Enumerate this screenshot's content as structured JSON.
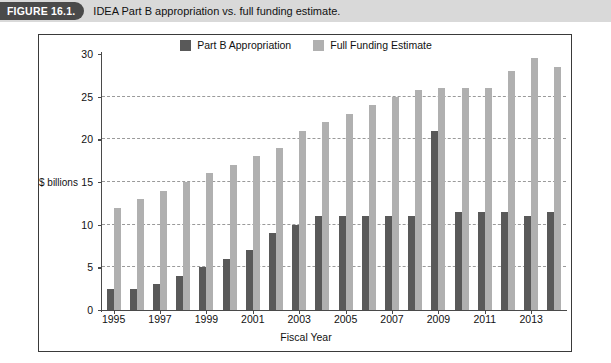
{
  "caption": {
    "figure_tag": "FIGURE 16.1.",
    "text": "IDEA Part B appropriation vs. full funding estimate."
  },
  "colors": {
    "dark_series": "#595959",
    "light_series": "#b0b0b0",
    "caption_band": "#d9d9d9",
    "figure_tag_bg": "#4a4a4a",
    "axis": "#4a4a4a",
    "gridline": "#9a9a9a"
  },
  "chart_data": {
    "type": "bar",
    "title": "",
    "xlabel": "Fiscal Year",
    "ylabel": "$ billions",
    "ylim": [
      0,
      30
    ],
    "yticks": [
      0,
      5,
      10,
      15,
      20,
      25,
      30
    ],
    "ytick_labels": [
      "0",
      "5",
      "10",
      "15",
      "20",
      "25",
      "30"
    ],
    "grid": true,
    "grid_axis": "y",
    "legend_position": "top-center",
    "categories": [
      "1995",
      "1996",
      "1997",
      "1998",
      "1999",
      "2000",
      "2001",
      "2002",
      "2003",
      "2004",
      "2005",
      "2006",
      "2007",
      "2008",
      "2009",
      "2010",
      "2011",
      "2012",
      "2013",
      "2014"
    ],
    "xtick_labels": [
      "1995",
      "1997",
      "1999",
      "2001",
      "2003",
      "2005",
      "2007",
      "2009",
      "2011",
      "2013"
    ],
    "series": [
      {
        "name": "Part B Appropriation",
        "color": "#595959",
        "values": [
          2.5,
          2.5,
          3.0,
          4.0,
          5.0,
          6.0,
          7.0,
          9.0,
          10.0,
          11.0,
          11.0,
          11.0,
          11.0,
          11.0,
          21.0,
          11.5,
          11.5,
          11.5,
          11.0,
          11.5
        ]
      },
      {
        "name": "Full Funding Estimate",
        "color": "#b0b0b0",
        "values": [
          12.0,
          13.0,
          14.0,
          15.0,
          16.0,
          17.0,
          18.0,
          19.0,
          21.0,
          22.0,
          23.0,
          24.0,
          25.0,
          25.8,
          26.0,
          26.0,
          26.0,
          28.0,
          29.5,
          28.5
        ]
      }
    ]
  }
}
